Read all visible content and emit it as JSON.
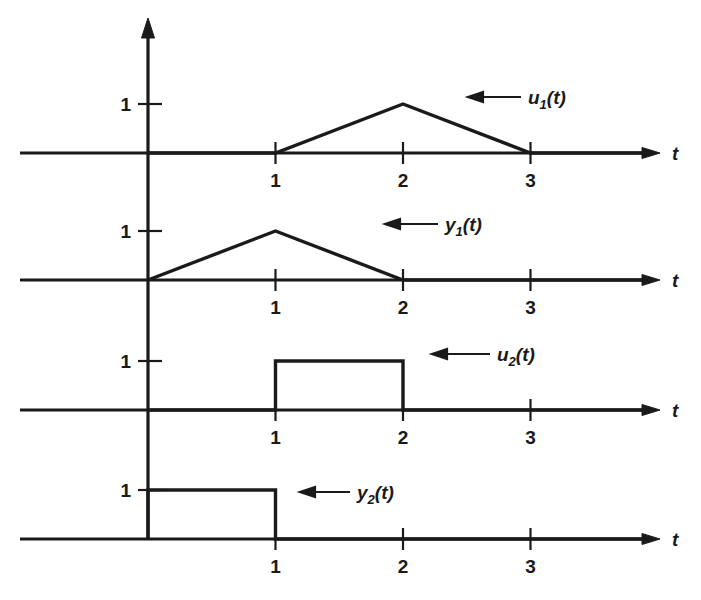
{
  "figure": {
    "title": "",
    "x_axis_label": "t",
    "y_level_label": "1",
    "annotation_arrow": "left-arrow-icon",
    "line_color": "#1a1a1a",
    "background_color": "#ffffff"
  },
  "chart_data": {
    "type": "line",
    "title": "",
    "xlabel": "t",
    "ylabel": "",
    "grid": false,
    "legend": "inline-annotations",
    "panels": [
      {
        "id": "panel-u1",
        "label": "u1(t)",
        "label_base": "u",
        "label_sub": "1",
        "label_suffix": "(t)",
        "xlabel": "t",
        "xticks": [
          1,
          2,
          3
        ],
        "xtick_labels": [
          "1",
          "2",
          "3"
        ],
        "ylim": [
          0,
          1
        ],
        "yticks": [
          1
        ],
        "ytick_labels": [
          "1"
        ],
        "description": "triangular pulse rising from t=1 to peak 1 at t=2, falling to 0 at t=3",
        "x": [
          0,
          1,
          2,
          3,
          3.9
        ],
        "y": [
          0,
          0,
          1,
          0,
          0
        ]
      },
      {
        "id": "panel-y1",
        "label": "y1(t)",
        "label_base": "y",
        "label_sub": "1",
        "label_suffix": "(t)",
        "xlabel": "t",
        "xticks": [
          1,
          2,
          3
        ],
        "xtick_labels": [
          "1",
          "2",
          "3"
        ],
        "ylim": [
          0,
          1
        ],
        "yticks": [
          1
        ],
        "ytick_labels": [
          "1"
        ],
        "description": "triangular pulse rising from t=0 to peak 1 at t=1, falling to 0 at t=2",
        "x": [
          0,
          1,
          2,
          3.9
        ],
        "y": [
          0,
          1,
          0,
          0
        ]
      },
      {
        "id": "panel-u2",
        "label": "u2(t)",
        "label_base": "u",
        "label_sub": "2",
        "label_suffix": "(t)",
        "xlabel": "t",
        "xticks": [
          1,
          2,
          3
        ],
        "xtick_labels": [
          "1",
          "2",
          "3"
        ],
        "ylim": [
          0,
          1
        ],
        "yticks": [
          1
        ],
        "ytick_labels": [
          "1"
        ],
        "description": "rectangular pulse of height 1 from t=1 to t=2",
        "x": [
          0,
          1,
          1,
          2,
          2,
          3.9
        ],
        "y": [
          0,
          0,
          1,
          1,
          0,
          0
        ]
      },
      {
        "id": "panel-y2",
        "label": "y2(t)",
        "label_base": "y",
        "label_sub": "2",
        "label_suffix": "(t)",
        "xlabel": "t",
        "xticks": [
          1,
          2,
          3
        ],
        "xtick_labels": [
          "1",
          "2",
          "3"
        ],
        "ylim": [
          0,
          1
        ],
        "yticks": [
          1
        ],
        "ytick_labels": [
          "1"
        ],
        "description": "rectangular pulse of height 1 from t=0 to t=1",
        "x": [
          0,
          0,
          1,
          1,
          3.9
        ],
        "y": [
          0,
          1,
          1,
          0,
          0
        ]
      }
    ]
  }
}
